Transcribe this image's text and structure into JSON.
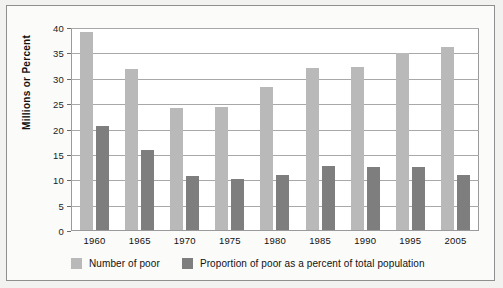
{
  "chart_data": {
    "type": "bar",
    "title": "",
    "xlabel": "",
    "ylabel": "Millions or Percent",
    "ylim": [
      0,
      40
    ],
    "yticks": [
      0,
      5,
      10,
      15,
      20,
      25,
      30,
      35,
      40
    ],
    "grid": true,
    "legend_position": "bottom-left",
    "categories": [
      "1960",
      "1965",
      "1970",
      "1975",
      "1980",
      "1985",
      "1990",
      "1995",
      "2005"
    ],
    "series": [
      {
        "name": "Number of poor",
        "color": "#b9b9b9",
        "values": [
          39.5,
          32.1,
          24.3,
          24.5,
          28.5,
          32.2,
          32.4,
          35.3,
          36.4
        ]
      },
      {
        "name": "Proportion of poor as a percent of total population",
        "color": "#7e7e7e",
        "values": [
          20.7,
          16.0,
          10.8,
          10.2,
          11.0,
          12.8,
          12.5,
          12.5,
          11.0
        ]
      }
    ]
  },
  "axis": {
    "y_title": "Millions or Percent"
  },
  "colors": {
    "series_light": "#b9b9b9",
    "series_dark": "#7e7e7e",
    "gridline": "#a8a8a8",
    "frame": "#8f8f8f",
    "page_background": "#f2f2f0"
  }
}
